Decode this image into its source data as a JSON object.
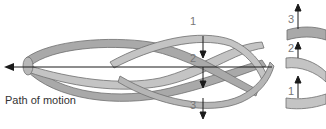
{
  "diagram": {
    "caption": "Path of motion",
    "left_labels": [
      "1",
      "2",
      "3"
    ],
    "right_labels": [
      "3",
      "2",
      "1"
    ],
    "colors": {
      "band_light": "#c4c4c4",
      "band_dark": "#a9a9a9",
      "outline": "#6f6f6f",
      "arrow": "#1a1a1a",
      "label": "#777777",
      "caption": "#333333"
    }
  }
}
